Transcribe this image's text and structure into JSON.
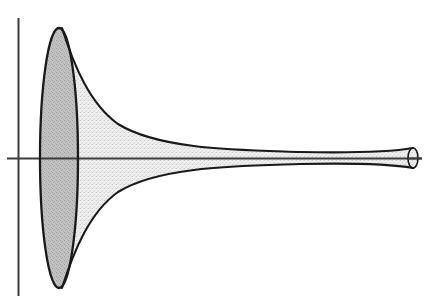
{
  "figure": {
    "name": "gabriels-horn-diagram",
    "title": "Gabriel's Horn",
    "background_color": "#ffffff",
    "stroke_color": "#1a1a1a",
    "axis_color": "#3d3d3d",
    "mouth_fill_color": "#b9b9b9",
    "body_fill_color": "#e9e9e9",
    "cap_fill_color": "#d8d8d8"
  },
  "chart_data": {
    "type": "line",
    "title": "Gabriel's Horn",
    "xlabel": "",
    "ylabel": "",
    "xlim": [
      0,
      426
    ],
    "ylim": [
      302,
      0
    ],
    "grid": false,
    "legend": null,
    "series": [
      {
        "name": "upper-profile",
        "description": "Upper generating curve of the horn, from the mouth apex tapering to the right opening",
        "x": [
          62,
          70,
          82,
          100,
          125,
          155,
          190,
          230,
          270,
          310,
          350,
          385,
          408,
          413
        ],
        "y": [
          28,
          48,
          74,
          98,
          117,
          131,
          139,
          144,
          147,
          149,
          150,
          150,
          149,
          148
        ]
      },
      {
        "name": "lower-profile",
        "description": "Lower generating curve of the horn, mirror of the upper profile about the horizontal axis",
        "x": [
          62,
          70,
          82,
          100,
          125,
          155,
          190,
          230,
          270,
          310,
          350,
          385,
          408,
          413
        ],
        "y": [
          288,
          268,
          242,
          218,
          199,
          185,
          177,
          172,
          169,
          167,
          166,
          166,
          167,
          168
        ]
      },
      {
        "name": "horizontal-axis",
        "description": "Axis of revolution",
        "x": [
          7,
          422
        ],
        "y": [
          158,
          158
        ]
      },
      {
        "name": "vertical-axis",
        "description": "Vertical coordinate axis",
        "x": [
          18,
          18
        ],
        "y": [
          18,
          296
        ]
      }
    ],
    "shapes": [
      {
        "name": "mouth-ellipse",
        "type": "ellipse",
        "cx": 59,
        "cy": 158,
        "rx": 19,
        "ry": 130,
        "fill": "#b9b9b9",
        "label": "shaded elliptical mouth of the horn"
      },
      {
        "name": "end-cap-ellipse",
        "type": "ellipse",
        "cx": 413,
        "cy": 158,
        "rx": 5,
        "ry": 10,
        "fill": "#d8d8d8",
        "label": "small elliptical opening at the narrow end"
      }
    ]
  },
  "annotations": {
    "axis_origin_label": "",
    "curve_equation_label": "",
    "caption": ""
  }
}
